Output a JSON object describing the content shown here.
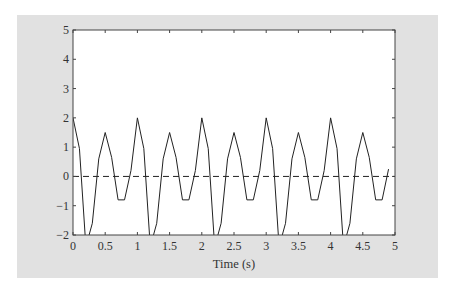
{
  "chart_data": {
    "type": "line",
    "title": "",
    "xlabel": "Time (s)",
    "ylabel": "",
    "xlim": [
      0,
      5
    ],
    "ylim": [
      -2,
      5
    ],
    "grid": false,
    "x_ticks": [
      "0",
      "0.5",
      "1",
      "1.5",
      "2",
      "2.5",
      "3",
      "3.5",
      "4",
      "4.5",
      "5"
    ],
    "x_tick_values": [
      0,
      0.5,
      1,
      1.5,
      2,
      2.5,
      3,
      3.5,
      4,
      4.5,
      5
    ],
    "y_ticks": [
      "−2",
      "−1",
      "0",
      "1",
      "2",
      "3",
      "4",
      "5"
    ],
    "y_tick_values": [
      -2,
      -1,
      0,
      1,
      2,
      3,
      4,
      5
    ],
    "series": [
      {
        "name": "signal",
        "style": "solid",
        "color": "#222222",
        "x": [
          0,
          0.1,
          0.2,
          0.3,
          0.4,
          0.5,
          0.6,
          0.7,
          0.8,
          0.9,
          1.0,
          1.1,
          1.2,
          1.3,
          1.4,
          1.5,
          1.6,
          1.7,
          1.8,
          1.9,
          2.0,
          2.1,
          2.2,
          2.3,
          2.4,
          2.5,
          2.6,
          2.7,
          2.8,
          2.9,
          3.0,
          3.1,
          3.2,
          3.3,
          3.4,
          3.5,
          3.6,
          3.7,
          3.8,
          3.9,
          4.0,
          4.1,
          4.2,
          4.3,
          4.4,
          4.5,
          4.6,
          4.7,
          4.8,
          4.9
        ],
        "y": [
          2.0,
          0.95,
          -2.4,
          -1.6,
          0.6,
          1.5,
          0.65,
          -0.8,
          -0.8,
          0.2,
          2.0,
          0.95,
          -2.4,
          -1.6,
          0.6,
          1.5,
          0.65,
          -0.8,
          -0.8,
          0.2,
          2.0,
          0.95,
          -2.4,
          -1.6,
          0.6,
          1.5,
          0.65,
          -0.8,
          -0.8,
          0.2,
          2.0,
          0.95,
          -2.4,
          -1.6,
          0.6,
          1.5,
          0.65,
          -0.8,
          -0.8,
          0.2,
          2.0,
          0.95,
          -2.4,
          -1.6,
          0.6,
          1.5,
          0.65,
          -0.8,
          -0.8,
          0.25
        ]
      },
      {
        "name": "zero-reference",
        "style": "dashed",
        "color": "#222222",
        "x": [
          0,
          5
        ],
        "y": [
          0,
          0
        ]
      }
    ],
    "legend": "none"
  },
  "colors": {
    "panel_background": "#e1e1e1",
    "plot_background": "#ffffff",
    "axis": "#333333"
  }
}
